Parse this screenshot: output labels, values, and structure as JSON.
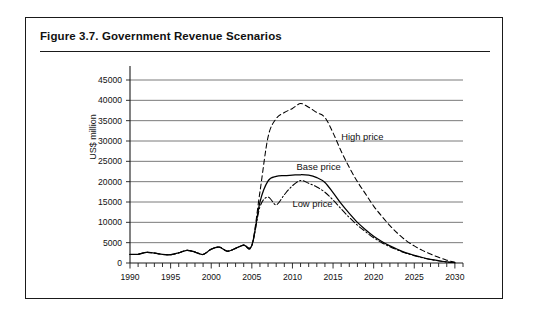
{
  "figure": {
    "number": "Figure 3.7.",
    "title": "Figure 3.7.  Government Revenue Scenarios",
    "caption_text": "Government Revenue Scenarios"
  },
  "chart_data": {
    "type": "line",
    "title": "Government Revenue Scenarios",
    "xlabel": "",
    "ylabel": "US$ million",
    "xlim": [
      1990,
      2031
    ],
    "ylim": [
      0,
      45000
    ],
    "ytick_step": 5000,
    "yticks": [
      "0",
      "5000",
      "10000",
      "15000",
      "20000",
      "25000",
      "30000",
      "35000",
      "40000",
      "45000"
    ],
    "xticks": [
      "1990",
      "1995",
      "2000",
      "2005",
      "2010",
      "2015",
      "2020",
      "2025",
      "2030"
    ],
    "xtick_minor_step": 1,
    "grid": "horizontal",
    "legend": "inline-annotations",
    "x": [
      1990,
      1991,
      1992,
      1993,
      1994,
      1995,
      1996,
      1997,
      1998,
      1999,
      2000,
      2001,
      2002,
      2003,
      2004,
      2005,
      2006,
      2007,
      2008,
      2009,
      2010,
      2011,
      2012,
      2013,
      2014,
      2015,
      2016,
      2017,
      2018,
      2019,
      2020,
      2021,
      2022,
      2023,
      2024,
      2025,
      2026,
      2027,
      2028,
      2029,
      2030
    ],
    "series": [
      {
        "name": "High price",
        "style": "dashed",
        "label": "High price",
        "values": [
          2100,
          2150,
          2600,
          2450,
          2100,
          2050,
          2500,
          3100,
          2700,
          2100,
          3400,
          3900,
          2900,
          3600,
          4400,
          4300,
          17500,
          31000,
          35500,
          37000,
          38000,
          39200,
          38300,
          37000,
          35800,
          32000,
          27500,
          23500,
          20000,
          17000,
          14000,
          11500,
          9200,
          7200,
          5500,
          4200,
          3100,
          2200,
          1400,
          700,
          200
        ]
      },
      {
        "name": "Base price",
        "style": "solid",
        "label": "Base price",
        "values": [
          2100,
          2150,
          2600,
          2450,
          2100,
          2050,
          2500,
          3100,
          2700,
          2100,
          3400,
          3900,
          2900,
          3600,
          4400,
          4300,
          15000,
          20200,
          21300,
          21500,
          21600,
          21700,
          21600,
          21000,
          19800,
          17300,
          14600,
          12200,
          10000,
          8200,
          6600,
          5300,
          4200,
          3300,
          2500,
          1900,
          1350,
          900,
          550,
          250,
          100
        ]
      },
      {
        "name": "Low price",
        "style": "dash-dot",
        "label": "Low price",
        "values": [
          2100,
          2150,
          2600,
          2450,
          2100,
          2050,
          2500,
          3100,
          2700,
          2100,
          3400,
          3900,
          2900,
          3600,
          4400,
          4300,
          13800,
          16200,
          14300,
          16800,
          19000,
          20300,
          19600,
          18700,
          17400,
          15500,
          13300,
          11200,
          9300,
          7700,
          6200,
          5000,
          4000,
          3150,
          2400,
          1800,
          1300,
          870,
          530,
          240,
          100
        ]
      }
    ],
    "annotations": [
      {
        "text": "High price",
        "x": 2016,
        "y": 31000
      },
      {
        "text": "Base price",
        "x": 2010.5,
        "y": 23500
      },
      {
        "text": "Low price",
        "x": 2010,
        "y": 14500
      }
    ],
    "colors": {
      "line": "#000000",
      "grid": "#6b6b6b",
      "axis": "#1a1a1a",
      "background": "#ffffff",
      "border": "#1a1a1a"
    }
  }
}
